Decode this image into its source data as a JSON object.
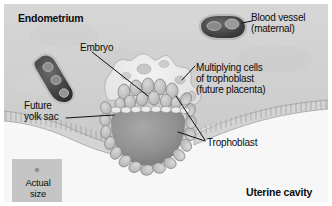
{
  "figure": {
    "type": "anatomical-illustration",
    "style": "grayscale",
    "width": 332,
    "height": 206,
    "colors": {
      "endometrium_bg": "#d2d2d2",
      "uterine_cavity_bg": "#f6f6f6",
      "epithelium": "#cfcfcf",
      "blastocyst_cavity": "#8f8f8f",
      "trophoblast_cells": "#bdbdbd",
      "syncytium": "#e8e8e8",
      "blood_vessel": "#4a4a4a",
      "label_text": "#0d0d0d",
      "leader_line": "#111111",
      "scale_box": "#c4c4c4",
      "frame": "#ffffff"
    }
  },
  "labels": {
    "endometrium": "Endometrium",
    "blood_vessel_line1": "Blood vessel",
    "blood_vessel_line2": "(maternal)",
    "embryo": "Embryo",
    "multiplying_line1": "Multiplying cells",
    "multiplying_line2": "of trophoblast",
    "multiplying_line3": "(future placenta)",
    "future_yolk_line1": "Future",
    "future_yolk_line2": "yolk sac",
    "trophoblast": "Trophoblast",
    "uterine_cavity": "Uterine cavity",
    "actual_size_line1": "Actual",
    "actual_size_line2": "size"
  },
  "structures": {
    "blood_vessels": [
      {
        "name": "maternal-blood-vessel-upper-right",
        "position": "top-right",
        "orientation": "horizontal-oval"
      },
      {
        "name": "maternal-blood-vessel-left",
        "position": "mid-left",
        "orientation": "diagonal-elongated"
      }
    ],
    "embryo_parts": [
      "syncytiotrophoblast",
      "inner-cell-mass",
      "blastocyst-cavity",
      "trophoblast-cell-ring",
      "future-yolk-sac-layer"
    ],
    "uterine_epithelium": "columnar-epithelial-band",
    "actual_size_marker": "small-dot"
  }
}
